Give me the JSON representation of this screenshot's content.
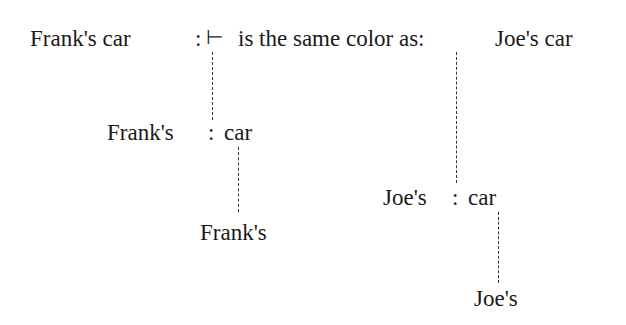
{
  "diagram": {
    "top_line": {
      "subject": "Frank's car",
      "colon": ":",
      "turnstile": "⊢",
      "predicate": "is the same color as:",
      "object": "Joe's car"
    },
    "frank_branch": {
      "modifier": "Frank's",
      "colon": ":",
      "head": "car",
      "leaf": "Frank's"
    },
    "joe_branch": {
      "modifier": "Joe's",
      "colon": ":",
      "head": "car",
      "leaf": "Joe's"
    },
    "connector_style": "dashed",
    "text_color": "#1a1a1a",
    "line_color": "#333333"
  }
}
